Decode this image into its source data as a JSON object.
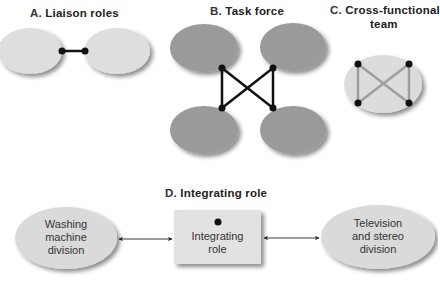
{
  "panels": {
    "a": {
      "letter": "A.",
      "title": "Liaison roles"
    },
    "b": {
      "letter": "B.",
      "title": "Task force"
    },
    "c": {
      "letter": "C.",
      "title_line1": "Cross-functional",
      "title_line2": "team"
    },
    "d": {
      "letter": "D.",
      "title": "Integrating role",
      "left_node": {
        "line1": "Washing",
        "line2": "machine",
        "line3": "division"
      },
      "center_node": {
        "line1": "Integrating",
        "line2": "role"
      },
      "right_node": {
        "line1": "Television",
        "line2": "and stereo",
        "line3": "division"
      }
    }
  },
  "colors": {
    "light_ellipse": "#dcdcdc",
    "dark_ellipse": "#9a9a9a",
    "connector_dark": "#111111",
    "connector_gray": "#9e9e9e",
    "box_fill": "#e2e2e2"
  }
}
